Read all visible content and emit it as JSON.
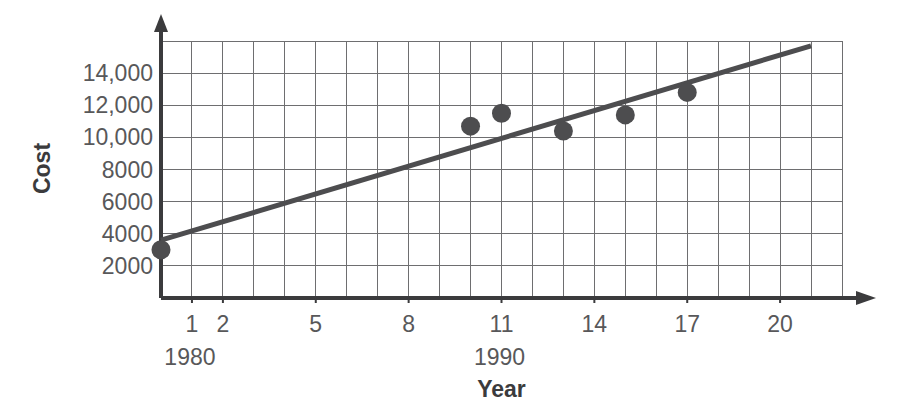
{
  "chart_data": {
    "type": "scatter",
    "title": "",
    "subtitle": "",
    "xlabel": "Year",
    "ylabel": "Cost",
    "x": [
      0,
      10,
      11,
      13,
      15,
      17
    ],
    "values": [
      3000,
      10700,
      11500,
      10400,
      11400,
      12800
    ],
    "points": [
      {
        "x": 0,
        "y": 3000
      },
      {
        "x": 10,
        "y": 10700
      },
      {
        "x": 11,
        "y": 11500
      },
      {
        "x": 13,
        "y": 10400
      },
      {
        "x": 15,
        "y": 11400
      },
      {
        "x": 17,
        "y": 12800
      }
    ],
    "trend_line": {
      "name": "line of best fit",
      "x_start": 0,
      "y_start": 3600,
      "x_end": 21,
      "y_end": 15700
    },
    "xlim": [
      0,
      22
    ],
    "ylim": [
      0,
      16000
    ],
    "x_tick_values": [
      1,
      2,
      5,
      8,
      11,
      14,
      17,
      20
    ],
    "x_tick_labels": [
      "1",
      "2",
      "5",
      "8",
      "11",
      "14",
      "17",
      "20"
    ],
    "y_tick_values": [
      2000,
      4000,
      6000,
      8000,
      10000,
      12000,
      14000
    ],
    "y_tick_labels": [
      "2000",
      "4000",
      "6000",
      "8000",
      "10,000",
      "12,000",
      "14,000"
    ],
    "decade_labels": [
      {
        "at_x": 1,
        "text": "1980"
      },
      {
        "at_x": 11,
        "text": "1990"
      }
    ],
    "grid": true,
    "grid_x_step": 1,
    "grid_y_step": 2000,
    "legend": "none",
    "legend_position": "none",
    "annotations": []
  },
  "style": {
    "background": "#ffffff",
    "grid_color": "#6e6e70",
    "axis_color": "#3b3b3d",
    "marker_color": "#4d4d4f",
    "line_color": "#4d4d4f",
    "tick_text_color": "#58585a",
    "title_text_color": "#3b3b3d"
  }
}
